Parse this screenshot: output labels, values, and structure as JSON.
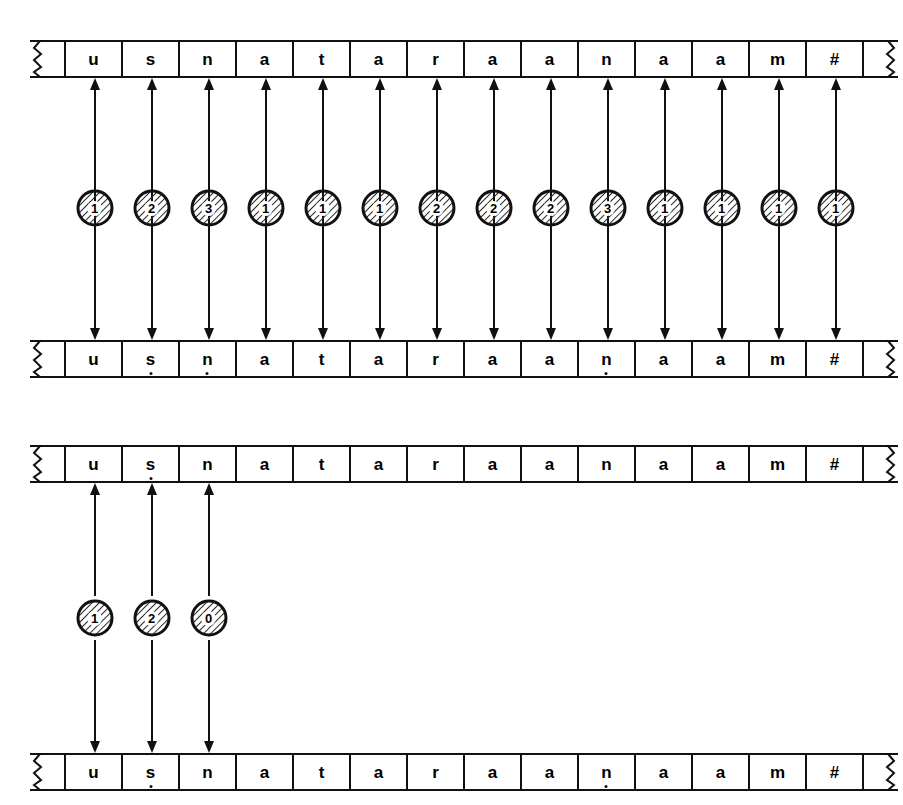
{
  "figure": {
    "type": "two-level-tape-alignment-diagram"
  },
  "colors": {
    "ink": "#111111",
    "paper": "#ffffff",
    "hatch": "#2b2b2b"
  },
  "diagrams": [
    {
      "id": "diagram-top",
      "name": "full-alignment-diagram",
      "upper_tape": {
        "name": "upper-tape-top",
        "cells": [
          {
            "text": "u",
            "dot": false
          },
          {
            "text": "s",
            "dot": false
          },
          {
            "text": "n",
            "dot": false
          },
          {
            "text": "a",
            "dot": false
          },
          {
            "text": "t",
            "dot": false
          },
          {
            "text": "a",
            "dot": false
          },
          {
            "text": "r",
            "dot": false
          },
          {
            "text": "a",
            "dot": false
          },
          {
            "text": "a",
            "dot": false
          },
          {
            "text": "n",
            "dot": false
          },
          {
            "text": "a",
            "dot": false
          },
          {
            "text": "a",
            "dot": false
          },
          {
            "text": "m",
            "dot": false
          },
          {
            "text": "#",
            "dot": false
          }
        ]
      },
      "lower_tape": {
        "name": "lower-tape-top",
        "cells": [
          {
            "text": "u",
            "dot": false
          },
          {
            "text": "s",
            "dot": true
          },
          {
            "text": "n",
            "dot": true
          },
          {
            "text": "a",
            "dot": false
          },
          {
            "text": "t",
            "dot": false
          },
          {
            "text": "a",
            "dot": false
          },
          {
            "text": "r",
            "dot": false
          },
          {
            "text": "a",
            "dot": false
          },
          {
            "text": "a",
            "dot": false
          },
          {
            "text": "n",
            "dot": true
          },
          {
            "text": "a",
            "dot": false
          },
          {
            "text": "a",
            "dot": false
          },
          {
            "text": "m",
            "dot": false
          },
          {
            "text": "#",
            "dot": false
          }
        ]
      },
      "nodes": [
        {
          "label": "1"
        },
        {
          "label": "2"
        },
        {
          "label": "3"
        },
        {
          "label": "1"
        },
        {
          "label": "1"
        },
        {
          "label": "1"
        },
        {
          "label": "2"
        },
        {
          "label": "2"
        },
        {
          "label": "2"
        },
        {
          "label": "3"
        },
        {
          "label": "1"
        },
        {
          "label": "1"
        },
        {
          "label": "1"
        },
        {
          "label": "1"
        }
      ]
    },
    {
      "id": "diagram-bottom",
      "name": "partial-alignment-diagram",
      "upper_tape": {
        "name": "upper-tape-bottom",
        "cells": [
          {
            "text": "u",
            "dot": false
          },
          {
            "text": "s",
            "dot": true
          },
          {
            "text": "n",
            "dot": false
          },
          {
            "text": "a",
            "dot": false
          },
          {
            "text": "t",
            "dot": false
          },
          {
            "text": "a",
            "dot": false
          },
          {
            "text": "r",
            "dot": false
          },
          {
            "text": "a",
            "dot": false
          },
          {
            "text": "a",
            "dot": false
          },
          {
            "text": "n",
            "dot": false
          },
          {
            "text": "a",
            "dot": false
          },
          {
            "text": "a",
            "dot": false
          },
          {
            "text": "m",
            "dot": false
          },
          {
            "text": "#",
            "dot": false
          }
        ]
      },
      "lower_tape": {
        "name": "lower-tape-bottom",
        "cells": [
          {
            "text": "u",
            "dot": false
          },
          {
            "text": "s",
            "dot": true
          },
          {
            "text": "n",
            "dot": false
          },
          {
            "text": "a",
            "dot": false
          },
          {
            "text": "t",
            "dot": false
          },
          {
            "text": "a",
            "dot": false
          },
          {
            "text": "r",
            "dot": false
          },
          {
            "text": "a",
            "dot": false
          },
          {
            "text": "a",
            "dot": false
          },
          {
            "text": "n",
            "dot": true
          },
          {
            "text": "a",
            "dot": false
          },
          {
            "text": "a",
            "dot": false
          },
          {
            "text": "m",
            "dot": false
          },
          {
            "text": "#",
            "dot": false
          }
        ]
      },
      "nodes": [
        {
          "label": "1"
        },
        {
          "label": "2"
        },
        {
          "label": "0"
        }
      ]
    }
  ]
}
